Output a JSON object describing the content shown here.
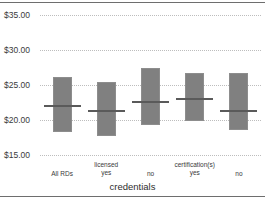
{
  "chart_data": {
    "type": "bar",
    "title": "",
    "subtitle": "",
    "xlabel": "credentials",
    "ylabel": "",
    "ylim": [
      15,
      35
    ],
    "yticks": [
      35,
      30,
      25,
      20,
      15
    ],
    "ytick_labels": [
      "$35.00",
      "$30.00",
      "$25.00",
      "$20.00",
      "$15.00"
    ],
    "grid": true,
    "grid_axis": "y",
    "grid_style": "dotted",
    "legend": false,
    "legend_position": "none",
    "currency": "USD",
    "value_prefix": "$",
    "categories": [
      "All RDs",
      "yes",
      "no",
      "yes",
      "no"
    ],
    "group_labels": [
      "",
      "licensed",
      "",
      "certification(s)",
      ""
    ],
    "bars": [
      {
        "category": "All RDs",
        "group": "",
        "level": "All RDs",
        "low": 18.3,
        "high": 26.1,
        "median": 22.1
      },
      {
        "category": "licensed yes",
        "group": "licensed",
        "level": "yes",
        "low": 17.7,
        "high": 25.4,
        "median": 21.4
      },
      {
        "category": "licensed no",
        "group": "",
        "level": "no",
        "low": 19.3,
        "high": 27.4,
        "median": 22.7
      },
      {
        "category": "certification(s) yes",
        "group": "certification(s)",
        "level": "yes",
        "low": 19.9,
        "high": 26.7,
        "median": 23.1
      },
      {
        "category": "certification(s) no",
        "group": "",
        "level": "no",
        "low": 18.5,
        "high": 26.7,
        "median": 21.5
      }
    ],
    "series": [
      {
        "name": "range-low",
        "values": [
          18.3,
          17.7,
          19.3,
          19.9,
          18.5
        ]
      },
      {
        "name": "range-high",
        "values": [
          26.1,
          25.4,
          27.4,
          26.7,
          26.7
        ]
      },
      {
        "name": "median",
        "values": [
          22.1,
          21.4,
          22.7,
          23.1,
          21.5
        ]
      }
    ],
    "colors": {
      "bar_fill": "#808080",
      "bar_edge": "#8d8d8d",
      "median_line": "#5a5a5a",
      "gridline": "#bdbdbd",
      "axis_rule": "#6e6e6e",
      "text": "#3a3a3a",
      "background": "#ffffff"
    }
  }
}
